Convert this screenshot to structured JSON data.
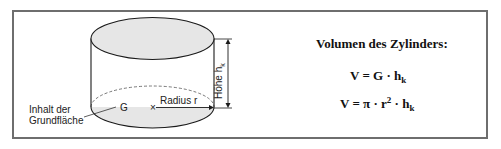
{
  "diagram": {
    "labels": {
      "height": "Höhe h",
      "height_sub": "k",
      "radius": "Radius r",
      "base_symbol": "G",
      "base_area_line1": "Inhalt der",
      "base_area_line2": "Grundfläche"
    },
    "colors": {
      "fill": "#e6e6e6",
      "stroke": "#1a1a1a",
      "frame": "#6e6e6e"
    }
  },
  "formulas": {
    "title": "Volumen des Zylinders:",
    "f1": {
      "lhs": "V = G · h",
      "sub": "k"
    },
    "f2": {
      "lhs": "V = π · r",
      "sup": "2",
      "mid": " · h",
      "sub": "k"
    }
  }
}
